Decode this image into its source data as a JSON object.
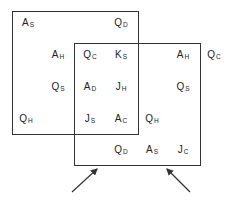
{
  "diagram": {
    "boxes": [
      {
        "name": "upper-left-grid",
        "left": 12,
        "top": 11,
        "width": 127,
        "height": 124
      },
      {
        "name": "lower-right-grid",
        "left": 74,
        "top": 43,
        "width": 127,
        "height": 123
      }
    ],
    "cards": [
      {
        "rank": "A",
        "suit": "S",
        "x": 28,
        "y": 24
      },
      {
        "rank": "Q",
        "suit": "D",
        "x": 121,
        "y": 24
      },
      {
        "rank": "A",
        "suit": "H",
        "x": 58,
        "y": 56
      },
      {
        "rank": "Q",
        "suit": "C",
        "x": 90,
        "y": 56
      },
      {
        "rank": "K",
        "suit": "S",
        "x": 121,
        "y": 56
      },
      {
        "rank": "A",
        "suit": "H",
        "x": 183,
        "y": 56
      },
      {
        "rank": "Q",
        "suit": "C",
        "x": 214,
        "y": 56
      },
      {
        "rank": "Q",
        "suit": "S",
        "x": 58,
        "y": 88
      },
      {
        "rank": "A",
        "suit": "D",
        "x": 90,
        "y": 88
      },
      {
        "rank": "J",
        "suit": "H",
        "x": 121,
        "y": 88
      },
      {
        "rank": "Q",
        "suit": "S",
        "x": 183,
        "y": 88
      },
      {
        "rank": "Q",
        "suit": "H",
        "x": 26,
        "y": 120
      },
      {
        "rank": "J",
        "suit": "S",
        "x": 90,
        "y": 120
      },
      {
        "rank": "A",
        "suit": "C",
        "x": 121,
        "y": 120
      },
      {
        "rank": "Q",
        "suit": "H",
        "x": 152,
        "y": 120
      },
      {
        "rank": "Q",
        "suit": "D",
        "x": 121,
        "y": 151
      },
      {
        "rank": "A",
        "suit": "S",
        "x": 152,
        "y": 151
      },
      {
        "rank": "J",
        "suit": "C",
        "x": 183,
        "y": 151
      }
    ],
    "arrows": [
      {
        "name": "left-arrow",
        "x1": 72,
        "y1": 192,
        "x2": 97,
        "y2": 169
      },
      {
        "name": "right-arrow",
        "x1": 190,
        "y1": 192,
        "x2": 167,
        "y2": 169
      }
    ]
  }
}
